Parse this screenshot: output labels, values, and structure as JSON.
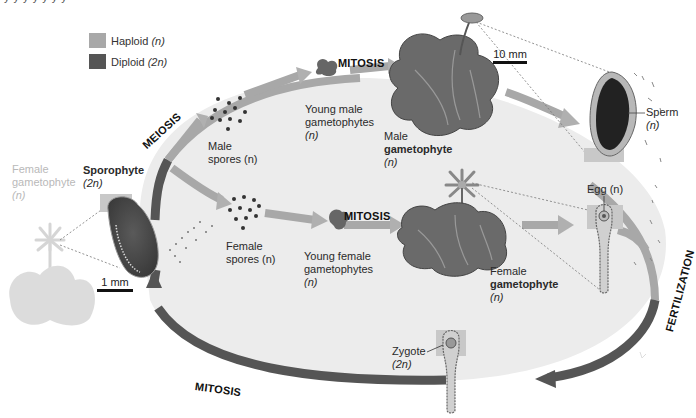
{
  "legend": {
    "items": [
      {
        "label": "Haploid",
        "suffix": "(n)",
        "color": "#a8a8a8"
      },
      {
        "label": "Diploid",
        "suffix": "(2n)",
        "color": "#555555"
      }
    ]
  },
  "stages": {
    "meiosis": "MEIOSIS",
    "mitosis_top": "MITOSIS",
    "mitosis_middle": "MITOSIS",
    "mitosis_bottom": "MITOSIS",
    "fertilization": "FERTILIZATION"
  },
  "labels": {
    "female_gametophyte_faded": {
      "line1": "Female",
      "line2": "gametophyte",
      "line3": "(n)"
    },
    "sporophyte": {
      "title": "Sporophyte",
      "ploidy": "(2n)"
    },
    "male_spores": {
      "line1": "Male",
      "line2": "spores (n)"
    },
    "female_spores": {
      "line1": "Female",
      "line2": "spores (n)"
    },
    "young_male": {
      "line1": "Young male",
      "line2": "gametophytes",
      "line3": "(n)"
    },
    "young_female": {
      "line1": "Young female",
      "line2": "gametophytes",
      "line3": "(n)"
    },
    "male_gametophyte": {
      "line1": "Male",
      "line2": "gametophyte",
      "line3": "(n)"
    },
    "female_gametophyte": {
      "line1": "Female",
      "line2": "gametophyte",
      "line3": "(n)"
    },
    "sperm": {
      "line1": "Sperm",
      "line2": "(n)"
    },
    "egg": {
      "text": "Egg (n)"
    },
    "zygote": {
      "line1": "Zygote",
      "line2": "(2n)"
    }
  },
  "scale_bars": {
    "top": "10 mm",
    "left": "1 mm"
  },
  "colors": {
    "haploid": "#a8a8a8",
    "diploid": "#555555",
    "cycle_fill": "#ececec",
    "plant_dark": "#6a6a6a",
    "plant_light": "#9a9a9a"
  },
  "top_cut_text": "y y y y y y y"
}
